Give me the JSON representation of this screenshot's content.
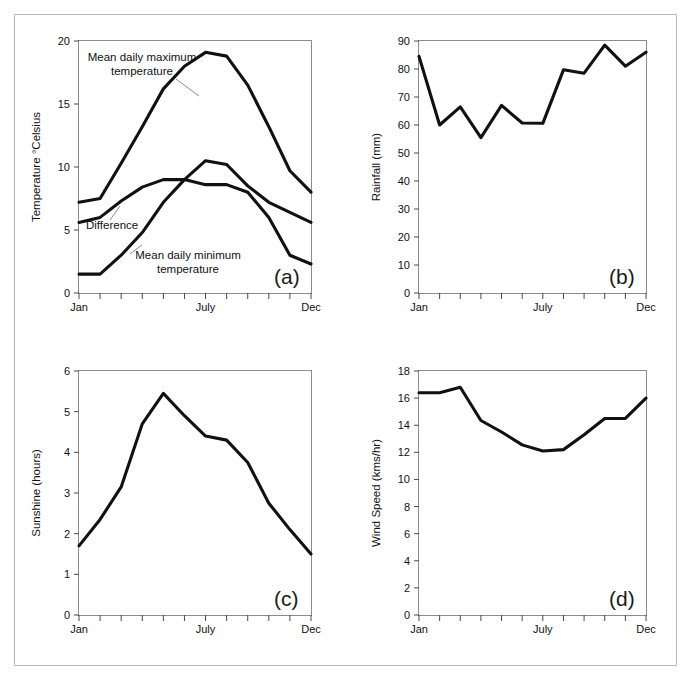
{
  "figure": {
    "background": "#ffffff",
    "border_color": "#b9b9b9",
    "line_color": "#111111"
  },
  "months": [
    "Jan",
    "Feb",
    "Mar",
    "Apr",
    "May",
    "Jun",
    "July",
    "Aug",
    "Sep",
    "Oct",
    "Nov",
    "Dec"
  ],
  "x_tick_labels_shown": [
    "Jan",
    "July",
    "Dec"
  ],
  "panels": {
    "a": {
      "label": "(a)",
      "ylabel": "Temperature °Celsius",
      "ytick_labels": [
        "0",
        "5",
        "10",
        "15",
        "20"
      ],
      "xtick_labels": [
        "Jan",
        "July",
        "Dec"
      ],
      "annotations": [
        "Mean daily maximum temperature",
        "Difference",
        "Mean daily minimum temperature"
      ],
      "annotation_max_line1": "Mean daily maximum",
      "annotation_max_line2": "temperature",
      "annotation_diff": "Difference",
      "annotation_min_line1": "Mean daily minimum",
      "annotation_min_line2": "temperature"
    },
    "b": {
      "label": "(b)",
      "ylabel": "Rainfall (mm)",
      "ytick_labels": [
        "0",
        "10",
        "20",
        "30",
        "40",
        "50",
        "60",
        "70",
        "80",
        "90"
      ],
      "xtick_labels": [
        "Jan",
        "July",
        "Dec"
      ]
    },
    "c": {
      "label": "(c)",
      "ylabel": "Sunshine (hours)",
      "ytick_labels": [
        "0",
        "1",
        "2",
        "3",
        "4",
        "5",
        "6"
      ],
      "xtick_labels": [
        "Jan",
        "July",
        "Dec"
      ]
    },
    "d": {
      "label": "(d)",
      "ylabel": "Wind Speed (kms/hr)",
      "ytick_labels": [
        "0",
        "2",
        "4",
        "6",
        "8",
        "10",
        "12",
        "14",
        "16",
        "18"
      ],
      "xtick_labels": [
        "Jan",
        "July",
        "Dec"
      ]
    }
  },
  "chart_data": [
    {
      "id": "a",
      "type": "line",
      "title": "(a)",
      "xlabel": "",
      "ylabel": "Temperature °Celsius",
      "categories": [
        "Jan",
        "Feb",
        "Mar",
        "Apr",
        "May",
        "Jun",
        "July",
        "Aug",
        "Sep",
        "Oct",
        "Nov",
        "Dec"
      ],
      "ylim": [
        0,
        20
      ],
      "yticks": [
        0,
        5,
        10,
        15,
        20
      ],
      "xtick_labels_visible": [
        "Jan",
        "July",
        "Dec"
      ],
      "grid": false,
      "legend": "annotations-inline",
      "series": [
        {
          "name": "Mean daily maximum temperature",
          "values": [
            7.2,
            7.5,
            10.3,
            13.2,
            16.2,
            18.0,
            19.1,
            18.8,
            16.5,
            13.2,
            9.7,
            8.0
          ]
        },
        {
          "name": "Difference",
          "values": [
            5.6,
            6.0,
            7.3,
            8.4,
            9.0,
            9.0,
            10.5,
            10.2,
            8.5,
            7.2,
            6.4,
            5.6
          ]
        },
        {
          "name": "Mean daily minimum temperature",
          "values": [
            1.5,
            1.5,
            3.0,
            4.8,
            7.2,
            9.0,
            8.6,
            8.6,
            8.0,
            6.0,
            3.0,
            2.3
          ]
        }
      ]
    },
    {
      "id": "b",
      "type": "line",
      "title": "(b)",
      "xlabel": "",
      "ylabel": "Rainfall (mm)",
      "categories": [
        "Jan",
        "Feb",
        "Mar",
        "Apr",
        "May",
        "Jun",
        "July",
        "Aug",
        "Sep",
        "Oct",
        "Nov",
        "Dec"
      ],
      "ylim": [
        0,
        90
      ],
      "yticks": [
        0,
        10,
        20,
        30,
        40,
        50,
        60,
        70,
        80,
        90
      ],
      "xtick_labels_visible": [
        "Jan",
        "July",
        "Dec"
      ],
      "grid": false,
      "values": [
        84.5,
        60.0,
        66.5,
        55.5,
        67.0,
        60.7,
        60.6,
        79.7,
        78.5,
        88.5,
        81.0,
        86.0
      ]
    },
    {
      "id": "c",
      "type": "line",
      "title": "(c)",
      "xlabel": "",
      "ylabel": "Sunshine (hours)",
      "categories": [
        "Jan",
        "Feb",
        "Mar",
        "Apr",
        "May",
        "Jun",
        "July",
        "Aug",
        "Sep",
        "Oct",
        "Nov",
        "Dec"
      ],
      "ylim": [
        0,
        6
      ],
      "yticks": [
        0,
        1,
        2,
        3,
        4,
        5,
        6
      ],
      "xtick_labels_visible": [
        "Jan",
        "July",
        "Dec"
      ],
      "grid": false,
      "values": [
        1.7,
        2.35,
        3.15,
        4.7,
        5.45,
        4.9,
        4.4,
        4.3,
        3.75,
        2.75,
        2.1,
        1.5
      ]
    },
    {
      "id": "d",
      "type": "line",
      "title": "(d)",
      "xlabel": "",
      "ylabel": "Wind Speed (kms/hr)",
      "categories": [
        "Jan",
        "Feb",
        "Mar",
        "Apr",
        "May",
        "Jun",
        "July",
        "Aug",
        "Sep",
        "Oct",
        "Nov",
        "Dec"
      ],
      "ylim": [
        0,
        18
      ],
      "yticks": [
        0,
        2,
        4,
        6,
        8,
        10,
        12,
        14,
        16,
        18
      ],
      "xtick_labels_visible": [
        "Jan",
        "July",
        "Dec"
      ],
      "grid": false,
      "values": [
        16.4,
        16.4,
        16.8,
        14.35,
        13.5,
        12.55,
        12.1,
        12.2,
        13.3,
        14.5,
        14.5,
        16.0
      ]
    }
  ]
}
